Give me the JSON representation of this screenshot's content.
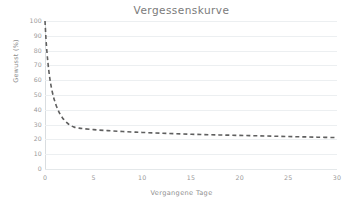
{
  "chart_data": {
    "type": "line",
    "title": "Vergessenskurve",
    "xlabel": "Vergangene Tage",
    "ylabel": "Gewusst (%)",
    "xlim": [
      0,
      30
    ],
    "ylim": [
      0,
      100
    ],
    "xticks": [
      0,
      5,
      10,
      15,
      20,
      25,
      30
    ],
    "xtick_labels": [
      "0",
      "5",
      "10",
      "15",
      "20",
      "25",
      "30"
    ],
    "yticks": [
      0,
      10,
      20,
      30,
      40,
      50,
      60,
      70,
      80,
      90,
      100
    ],
    "ytick_labels": [
      "0",
      "10",
      "20",
      "30",
      "40",
      "50",
      "60",
      "70",
      "80",
      "90",
      "100"
    ],
    "grid": true,
    "grid_axis": "y",
    "legend": false,
    "series": [
      {
        "name": "Vergessenskurve",
        "style": "dashed",
        "color": "#5f5f5f",
        "x": [
          0,
          0.1,
          0.2,
          0.3,
          0.4,
          0.5,
          0.6,
          0.75,
          0.9,
          1.0,
          1.2,
          1.4,
          1.6,
          1.8,
          2.0,
          2.3,
          2.6,
          3.0,
          3.5,
          4.0,
          5.0,
          6.0,
          7.0,
          8.0,
          9.0,
          10.0,
          12.0,
          14.0,
          16.0,
          18.0,
          20.0,
          22.0,
          24.0,
          26.0,
          28.0,
          30.0
        ],
        "y": [
          100,
          88,
          79,
          72,
          66,
          61,
          57,
          52,
          48,
          46,
          42,
          39,
          36.5,
          34.5,
          33,
          31,
          29.5,
          28.3,
          27.6,
          27.2,
          26.6,
          26.1,
          25.7,
          25.3,
          25.0,
          24.7,
          24.2,
          23.7,
          23.3,
          23.0,
          22.7,
          22.4,
          22.1,
          21.8,
          21.5,
          21.2
        ]
      }
    ]
  },
  "colors": {
    "background": "#ffffff",
    "title": "#7a7a7a",
    "axis_text": "#9a9a9a",
    "gridline": "#eceff1",
    "curve": "#5f5f5f"
  }
}
